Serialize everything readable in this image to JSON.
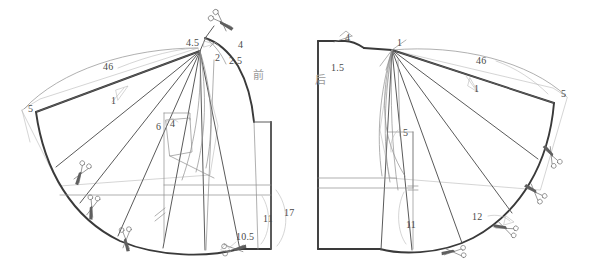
{
  "document": {
    "kind": "pattern-drafting-diagram",
    "description": "Garment pattern draft showing front and back panels with slash-and-spread flare lines",
    "width": 591,
    "height": 280,
    "background_color": "#ffffff",
    "ink_color": "#3a3a3a",
    "light_ink_color": "#9b9b9b",
    "label_color": "#4a4a4a"
  },
  "panels": [
    {
      "id": "front-panel",
      "name_label": "前",
      "name_label_x": 253,
      "name_label_y": 77
    },
    {
      "id": "back-panel",
      "name_label": "后",
      "name_label_x": 315,
      "name_label_y": 82
    }
  ],
  "measurements": [
    {
      "id": "front-shoulder-slope",
      "text": "4.5",
      "x": 186,
      "y": 38
    },
    {
      "id": "front-neck-drop",
      "text": "4",
      "x": 238,
      "y": 40
    },
    {
      "id": "front-dart-a",
      "text": "2",
      "x": 215,
      "y": 53
    },
    {
      "id": "front-dart-b",
      "text": "2.5",
      "x": 229,
      "y": 56
    },
    {
      "id": "front-hem-sweep",
      "text": "46",
      "x": 103,
      "y": 66
    },
    {
      "id": "front-spread-1",
      "text": "1",
      "x": 111,
      "y": 96
    },
    {
      "id": "front-side-rise",
      "text": "5",
      "x": 30,
      "y": 108
    },
    {
      "id": "front-pocket-width",
      "text": "6",
      "x": 158,
      "y": 127
    },
    {
      "id": "front-pocket-depth",
      "text": "4",
      "x": 172,
      "y": 124
    },
    {
      "id": "front-hip-height",
      "text": "11",
      "x": 265,
      "y": 219
    },
    {
      "id": "front-side-length",
      "text": "17",
      "x": 286,
      "y": 213
    },
    {
      "id": "front-hem-offset",
      "text": "10.5",
      "x": 238,
      "y": 237
    },
    {
      "id": "back-neck-drop",
      "text": "4",
      "x": 345,
      "y": 38
    },
    {
      "id": "back-shoulder-slope",
      "text": "1",
      "x": 397,
      "y": 41
    },
    {
      "id": "back-dart",
      "text": "1.5",
      "x": 333,
      "y": 68
    },
    {
      "id": "back-hem-sweep",
      "text": "46",
      "x": 478,
      "y": 60
    },
    {
      "id": "back-spread-1",
      "text": "1",
      "x": 476,
      "y": 87
    },
    {
      "id": "back-armhole",
      "text": "5",
      "x": 405,
      "y": 134
    },
    {
      "id": "back-side-rise",
      "text": "5",
      "x": 563,
      "y": 94
    },
    {
      "id": "back-hip-height",
      "text": "11",
      "x": 408,
      "y": 225
    },
    {
      "id": "back-hem-offset",
      "text": "12",
      "x": 474,
      "y": 218
    }
  ],
  "cut_marks": [
    {
      "id": "front-cut-shoulder",
      "x": 218,
      "y": 20,
      "rotation": -45
    },
    {
      "id": "front-cut-1",
      "x": 82,
      "y": 170,
      "rotation": 35
    },
    {
      "id": "front-cut-2",
      "x": 92,
      "y": 204,
      "rotation": 20
    },
    {
      "id": "front-cut-3",
      "x": 125,
      "y": 234,
      "rotation": 5
    },
    {
      "id": "front-cut-4",
      "x": 230,
      "y": 248,
      "rotation": -80
    },
    {
      "id": "back-cut-1",
      "x": 457,
      "y": 250,
      "rotation": 95
    },
    {
      "id": "back-cut-2",
      "x": 508,
      "y": 228,
      "rotation": 115
    },
    {
      "id": "back-cut-3",
      "x": 537,
      "y": 193,
      "rotation": 140
    },
    {
      "id": "back-cut-4",
      "x": 553,
      "y": 157,
      "rotation": 155
    }
  ],
  "notation_marks": [
    {
      "id": "front-grain-tick",
      "x": 160,
      "y": 212,
      "type": "double-slash"
    },
    {
      "id": "back-grain-tick",
      "x": 413,
      "y": 188,
      "type": "double-slash"
    }
  ]
}
